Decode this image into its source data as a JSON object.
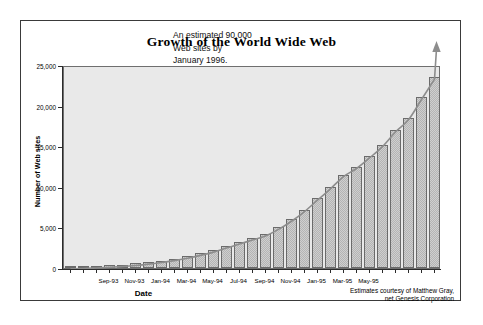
{
  "chart_data": {
    "type": "bar",
    "title": "Growth of the World Wide Web",
    "xlabel": "Date",
    "ylabel": "Number of Web sites",
    "ylim": [
      0,
      25000
    ],
    "y_ticks": [
      0,
      5000,
      10000,
      15000,
      20000,
      25000
    ],
    "y_tick_labels": [
      "0",
      "5,000",
      "10,000",
      "15,000",
      "20,000",
      "25,000"
    ],
    "grid": false,
    "legend": null,
    "categories": [
      "Jun-93",
      "Jul-93",
      "Aug-93",
      "Sep-93",
      "Oct-93",
      "Nov-93",
      "Dec-93",
      "Jan-94",
      "Feb-94",
      "Mar-94",
      "Apr-94",
      "May-94",
      "Jun-94",
      "Jul-94",
      "Aug-94",
      "Sep-94",
      "Oct-94",
      "Nov-94",
      "Dec-94",
      "Jan-95",
      "Feb-95",
      "Mar-95",
      "Apr-95",
      "May-95",
      "Jun-95",
      "Jul-95",
      "Aug-95",
      "Sep-95",
      "Oct-95"
    ],
    "values": [
      130,
      180,
      250,
      330,
      430,
      560,
      720,
      920,
      1150,
      1450,
      1800,
      2200,
      2700,
      3200,
      3700,
      4200,
      5000,
      6000,
      7200,
      8600,
      10000,
      11500,
      12500,
      13800,
      15200,
      17000,
      18500,
      21000,
      23500
    ],
    "x_tick_labels": [
      "Sep-93",
      "Nov-93",
      "Jan-94",
      "Mar-94",
      "May-94",
      "Jul-94",
      "Sep-94",
      "Nov-94",
      "Jan-95",
      "Mar-95",
      "May-95"
    ],
    "x_tick_label_indices": [
      3,
      5,
      7,
      9,
      11,
      13,
      15,
      17,
      19,
      21,
      23
    ],
    "annotations": [
      {
        "name": "estimate-note",
        "text": "An estimated 90,000\nWeb sites by\nJanuary 1996."
      },
      {
        "name": "source-credit",
        "text": "Estimates courtesy of Matthew Gray,\nnet.Genesis Corporation"
      }
    ],
    "trend_curve": {
      "name": "exponential-trend",
      "color": "#8d8d8d",
      "has_arrow_head": true,
      "description": "smooth exponential trend line rising through bar tops and continuing upward past the plot top as an arrow"
    },
    "colors": {
      "bar_fill": "#cfcfcf",
      "bar_pattern": "#b4b4b4",
      "bar_border": "#6b6b6b",
      "plot_background": "#e9e9e9",
      "axis": "#2b2b2b",
      "frame_border": "#3a3a3a",
      "text": "#000000"
    }
  }
}
